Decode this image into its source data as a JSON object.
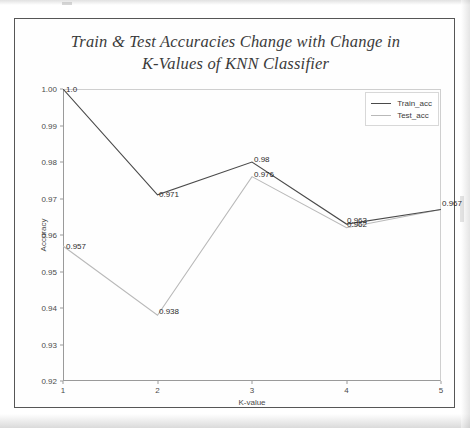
{
  "figure": {
    "title_line1": "Train & Test Accuracies Change with Change in",
    "title_line2": "K-Values of KNN Classifier"
  },
  "legend": {
    "position": "upper right",
    "entries": [
      {
        "label": "Train_acc",
        "color": "#4a4a4a"
      },
      {
        "label": "Test_acc",
        "color": "#b9b9b9"
      }
    ]
  },
  "axes": {
    "xlabel": "K-value",
    "ylabel": "Accuracy",
    "xticks": [
      "1",
      "2",
      "3",
      "4",
      "5"
    ],
    "yticks": [
      "0.92",
      "0.93",
      "0.94",
      "0.95",
      "0.96",
      "0.97",
      "0.98",
      "0.99",
      "1.00"
    ]
  },
  "annotations": {
    "train": [
      "1.0",
      "0.971",
      "0.98",
      "0.963",
      "0.967"
    ],
    "test": [
      "0.957",
      "0.938",
      "0.976",
      "0.962",
      "0.967"
    ]
  },
  "chart_data": {
    "type": "line",
    "title": "Train & Test Accuracies Change with Change in K-Values of KNN Classifier",
    "xlabel": "K-value",
    "ylabel": "Accuracy",
    "x": [
      1,
      2,
      3,
      4,
      5
    ],
    "xlim": [
      1,
      5
    ],
    "ylim": [
      0.92,
      1.0
    ],
    "grid": false,
    "legend_position": "upper right",
    "series": [
      {
        "name": "Train_acc",
        "color": "#4a4a4a",
        "values": [
          1.0,
          0.971,
          0.98,
          0.963,
          0.967
        ],
        "point_labels": [
          "1.0",
          "0.971",
          "0.98",
          "0.963",
          "0.967"
        ]
      },
      {
        "name": "Test_acc",
        "color": "#b9b9b9",
        "values": [
          0.957,
          0.938,
          0.976,
          0.962,
          0.967
        ],
        "point_labels": [
          "0.957",
          "0.938",
          "0.976",
          "0.962",
          "0.967"
        ]
      }
    ]
  }
}
